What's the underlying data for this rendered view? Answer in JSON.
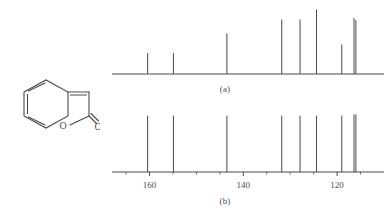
{
  "figure": {
    "panels": [
      {
        "id": "a",
        "label": "(a)"
      },
      {
        "id": "b",
        "label": "(b)"
      }
    ],
    "molecule": {
      "name": "coumarin-2h-chromen-2-one",
      "atom_labels": [
        {
          "text": "O",
          "x": 55,
          "y": 49
        },
        {
          "text": "O",
          "x": 86,
          "y": 51
        }
      ]
    }
  },
  "chart_data": [
    {
      "type": "bar",
      "id": "spectrum-a",
      "title": "",
      "subtitle": "(a)",
      "xlabel": "",
      "ylabel": "",
      "xlim": [
        168,
        110
      ],
      "ylim": [
        0,
        100
      ],
      "grid": false,
      "legend": null,
      "axis_direction": "reversed",
      "tick_labels": [],
      "x": [
        160.4,
        154.9,
        143.5,
        131.8,
        127.9,
        124.4,
        119.0,
        116.4,
        116.0
      ],
      "values": [
        30,
        30,
        58,
        78,
        78,
        92,
        42,
        80,
        77
      ],
      "categories": [
        "160.4",
        "154.9",
        "143.5",
        "131.8",
        "127.9",
        "124.4",
        "119.0",
        "116.4",
        "116.0"
      ]
    },
    {
      "type": "bar",
      "id": "spectrum-b",
      "title": "",
      "subtitle": "(b)",
      "xlabel": "",
      "ylabel": "",
      "xlim": [
        168,
        110
      ],
      "ylim": [
        0,
        100
      ],
      "grid": false,
      "legend": null,
      "axis_direction": "reversed",
      "tick_labels": [
        {
          "value": 160,
          "text": "160"
        },
        {
          "value": 140,
          "text": "140"
        },
        {
          "value": 120,
          "text": "120"
        }
      ],
      "minor_ticks": [
        165,
        155,
        150,
        145,
        135,
        130,
        125,
        115
      ],
      "x": [
        160.4,
        154.9,
        143.5,
        131.8,
        127.9,
        124.4,
        119.0,
        116.4,
        116.0
      ],
      "values": [
        94,
        94,
        94,
        94,
        94,
        94,
        94,
        96,
        96
      ],
      "categories": [
        "160.4",
        "154.9",
        "143.5",
        "131.8",
        "127.9",
        "124.4",
        "119.0",
        "116.4",
        "116.0"
      ]
    }
  ]
}
